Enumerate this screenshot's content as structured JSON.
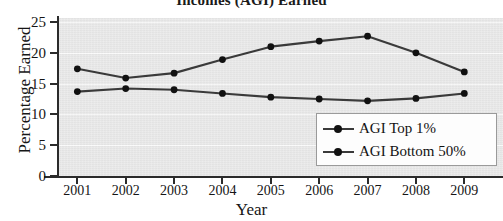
{
  "chart_data": {
    "type": "line",
    "title": "Incomes (AGI) Earned",
    "xlabel": "Year",
    "ylabel": "Percentage Earned",
    "categories": [
      "2001",
      "2002",
      "2003",
      "2004",
      "2005",
      "2006",
      "2007",
      "2008",
      "2009"
    ],
    "x": [
      2001,
      2002,
      2003,
      2004,
      2005,
      2006,
      2007,
      2008,
      2009
    ],
    "xlim": [
      2000.6,
      2009.8
    ],
    "ylim": [
      0,
      25
    ],
    "yticks": [
      0,
      5,
      10,
      15,
      20,
      25
    ],
    "ytick_labels": [
      "0",
      "5",
      "10",
      "15",
      "20",
      "25"
    ],
    "grid": true,
    "legend_position": "lower right",
    "series": [
      {
        "name": "AGI Top 1%",
        "values": [
          17.4,
          15.9,
          16.7,
          18.9,
          21.0,
          21.9,
          22.7,
          20.0,
          16.9
        ],
        "color": "#3a3a3a",
        "marker": "circle"
      },
      {
        "name": "AGI Bottom 50%",
        "values": [
          13.7,
          14.2,
          14.0,
          13.4,
          12.8,
          12.5,
          12.2,
          12.6,
          13.4
        ],
        "color": "#3a3a3a",
        "marker": "circle"
      }
    ]
  },
  "legend": {
    "entries": [
      {
        "label": "AGI Top 1%"
      },
      {
        "label": "AGI Bottom 50%"
      }
    ]
  },
  "colors": {
    "plot_background": "#e9e9e9",
    "gridline": "#fbfbfb",
    "axis": "#2b2b2b",
    "series_line": "#3a3a3a",
    "marker": "#111111",
    "text": "#151515"
  }
}
